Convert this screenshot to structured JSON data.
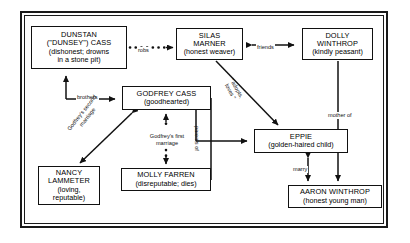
{
  "diagram": {
    "nodes": [
      {
        "id": "dunstan",
        "name_line1": "DUNSTAN",
        "name_line2": "(\"DUNSEY\") CASS",
        "desc_line1": "(dishonest; drowns",
        "desc_line2": "in a stone pit)"
      },
      {
        "id": "silas",
        "name_line1": "SILAS",
        "name_line2": "MARNER",
        "desc_line1": "(honest weaver)"
      },
      {
        "id": "dolly",
        "name_line1": "DOLLY",
        "name_line2": "WINTHROP",
        "desc_line1": "(kindly peasant)"
      },
      {
        "id": "godfrey",
        "name_line1": "GODFREY CASS",
        "desc_line1": "(goodhearted)"
      },
      {
        "id": "nancy",
        "name_line1": "NANCY",
        "name_line2": "LAMMETER",
        "desc_line1": "(loving,",
        "desc_line2": "reputable)"
      },
      {
        "id": "molly",
        "name_line1": "MOLLY FARREN",
        "desc_line1": "(disreputable; dies)"
      },
      {
        "id": "eppie",
        "name_line1": "EPPIE",
        "desc_line1": "(golden-haired child)"
      },
      {
        "id": "aaron",
        "name_line1": "AARON WINTHROP",
        "desc_line1": "(honest young man)"
      }
    ],
    "edges": [
      {
        "id": "robs",
        "label": "robs",
        "from": "dunstan",
        "to": "silas",
        "style": "dotted",
        "arrows": "one"
      },
      {
        "id": "friends",
        "label": "friends",
        "from": "silas",
        "to": "dolly",
        "style": "solid",
        "arrows": "both"
      },
      {
        "id": "brothers",
        "label": "brothers",
        "from": "godfrey",
        "to": "dunstan",
        "style": "solid",
        "arrows": "both"
      },
      {
        "id": "adopts",
        "label": "\" adopts,\nloves \"",
        "from": "silas",
        "to": "eppie",
        "style": "solid",
        "arrows": "one"
      },
      {
        "id": "gf2",
        "label": "Godfrey's second\nmarriage",
        "from": "godfrey",
        "to": "nancy",
        "style": "solid",
        "arrows": "both"
      },
      {
        "id": "gf1",
        "label": "Godfrey's first\nmarriage",
        "from": "godfrey",
        "to": "molly",
        "style": "dotted",
        "arrows": "both"
      },
      {
        "id": "parents",
        "label": "parents of",
        "from": "godfrey",
        "to": "eppie",
        "style": "solid",
        "arrows": "one"
      },
      {
        "id": "marry",
        "label": "marry",
        "from": "eppie",
        "to": "aaron",
        "style": "solid",
        "arrows": "both"
      },
      {
        "id": "mother",
        "label": "mother of",
        "from": "dolly",
        "to": "aaron",
        "style": "solid",
        "arrows": "one"
      }
    ],
    "edge_labels": {
      "robs": "robs",
      "friends": "friends",
      "brothers": "brothers",
      "adopts_l1": "\" adopts,",
      "adopts_l2": "loves \"",
      "gf2_l1": "Godfrey's second",
      "gf2_l2": "marriage",
      "gf1_l1": "Godfrey's first",
      "gf1_l2": "marriage",
      "parents": "parents of",
      "marry": "marry",
      "mother": "mother of"
    },
    "colors": {
      "line": "#111111",
      "frame": "#1a1a1a",
      "background": "#ffffff"
    }
  }
}
